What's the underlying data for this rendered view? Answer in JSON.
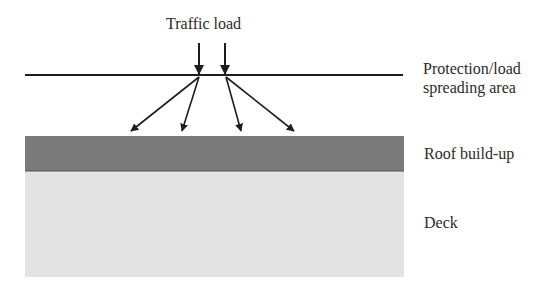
{
  "diagram": {
    "title_label": "Traffic load",
    "layers": [
      {
        "name": "protection",
        "label_line1": "Protection/load",
        "label_line2": "spreading area"
      },
      {
        "name": "roof",
        "label": "Roof build-up",
        "color": "#7a7a7a"
      },
      {
        "name": "deck",
        "label": "Deck",
        "color": "#e3e3e3"
      }
    ],
    "colors": {
      "line": "#1e1e1e",
      "roof": "#7a7a7a",
      "deck": "#e3e3e3"
    }
  }
}
